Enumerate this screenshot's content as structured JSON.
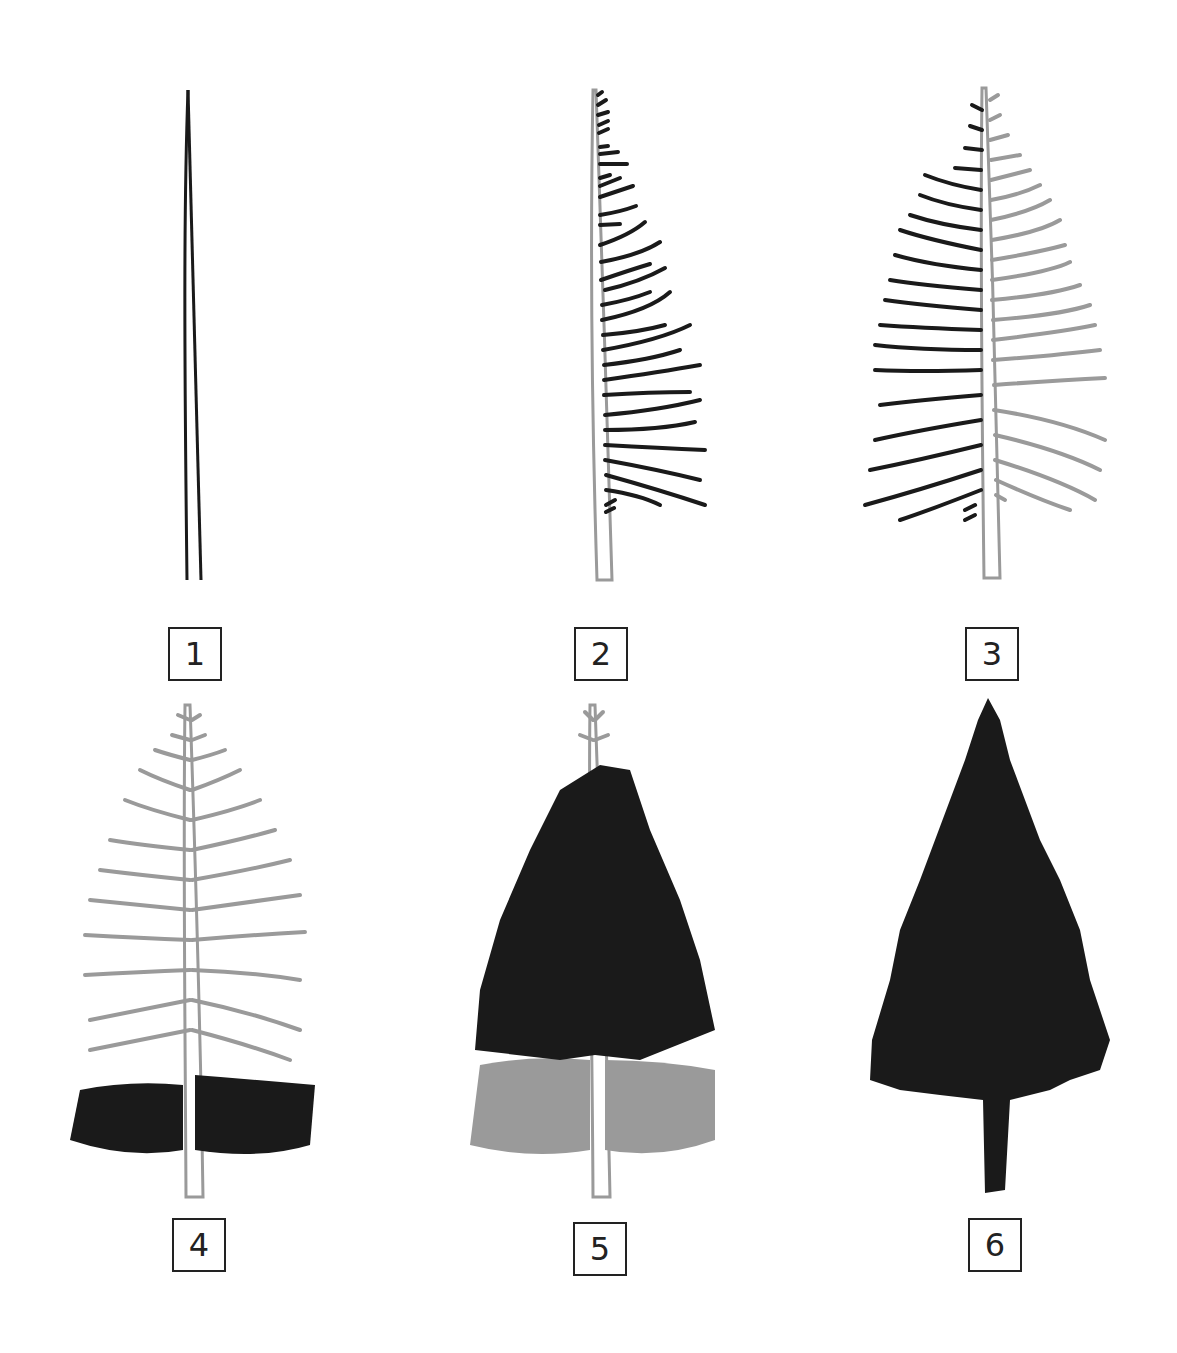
{
  "colors": {
    "ink": "#1a1a1a",
    "guide": "#9a9a9a",
    "background": "#ffffff"
  },
  "steps": [
    {
      "number": "1",
      "description": "Draw the trunk as two tapering lines"
    },
    {
      "number": "2",
      "description": "Add branches on one side"
    },
    {
      "number": "3",
      "description": "Add branches on the other side"
    },
    {
      "number": "4",
      "description": "Add needle texture to the lower branches"
    },
    {
      "number": "5",
      "description": "Continue needle texture upward"
    },
    {
      "number": "6",
      "description": "Fill in the final silhouette"
    }
  ]
}
